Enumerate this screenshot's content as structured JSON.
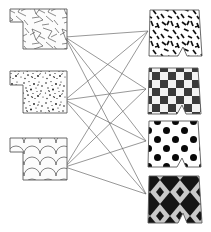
{
  "figure": {
    "width": 211,
    "height": 232,
    "background_color": "#ffffff",
    "edge_color": "#6b6b6b",
    "outline_color": "#5a5a5a",
    "ink_color": "#1a1a1a"
  },
  "left_column": {
    "label": "source-tiles",
    "shape_kind": "t-tab-tile",
    "items": [
      {
        "id": "L1",
        "texture_name": "cracked-shards",
        "texture_description": "irregular angular crack lines on white",
        "anchor": {
          "x": 65,
          "y": 37
        },
        "box": {
          "x": 10,
          "y": 8,
          "w": 57,
          "h": 41
        }
      },
      {
        "id": "L2",
        "texture_name": "fine-speckle",
        "texture_description": "dense small black specks and flecks on white",
        "anchor": {
          "x": 65,
          "y": 100
        },
        "box": {
          "x": 10,
          "y": 70,
          "w": 57,
          "h": 43
        }
      },
      {
        "id": "L3",
        "texture_name": "fish-scale-scallop",
        "texture_description": "overlapping scalloped arcs on white",
        "anchor": {
          "x": 65,
          "y": 167
        },
        "box": {
          "x": 10,
          "y": 137,
          "w": 57,
          "h": 43
        }
      }
    ]
  },
  "right_column": {
    "label": "target-tiles",
    "shape_kind": "notched-tile",
    "items": [
      {
        "id": "R1",
        "texture_name": "dashes-confetti",
        "texture_description": "scattered short black dashes on white",
        "anchor": {
          "x": 148,
          "y": 31
        },
        "box": {
          "x": 147,
          "y": 9,
          "w": 55,
          "h": 47
        }
      },
      {
        "id": "R2",
        "texture_name": "checkerboard",
        "texture_description": "alternating dark grey and light squares",
        "anchor": {
          "x": 146,
          "y": 89
        },
        "box": {
          "x": 146,
          "y": 67,
          "w": 55,
          "h": 47
        }
      },
      {
        "id": "R3",
        "texture_name": "polka-dots",
        "texture_description": "large black circles on white",
        "anchor": {
          "x": 146,
          "y": 141
        },
        "box": {
          "x": 146,
          "y": 121,
          "w": 55,
          "h": 46
        }
      },
      {
        "id": "R4",
        "texture_name": "argyle-diamonds",
        "texture_description": "black and light-grey diamond lattice",
        "anchor": {
          "x": 146,
          "y": 194
        },
        "box": {
          "x": 146,
          "y": 175,
          "w": 55,
          "h": 48
        }
      }
    ]
  },
  "edges": [
    {
      "from": "L1",
      "to": "R1"
    },
    {
      "from": "L1",
      "to": "R2"
    },
    {
      "from": "L1",
      "to": "R3"
    },
    {
      "from": "L1",
      "to": "R4"
    },
    {
      "from": "L2",
      "to": "R1"
    },
    {
      "from": "L2",
      "to": "R2"
    },
    {
      "from": "L2",
      "to": "R3"
    },
    {
      "from": "L2",
      "to": "R4"
    },
    {
      "from": "L3",
      "to": "R1"
    },
    {
      "from": "L3",
      "to": "R2"
    },
    {
      "from": "L3",
      "to": "R3"
    },
    {
      "from": "L3",
      "to": "R4"
    }
  ],
  "edge_count": 12
}
